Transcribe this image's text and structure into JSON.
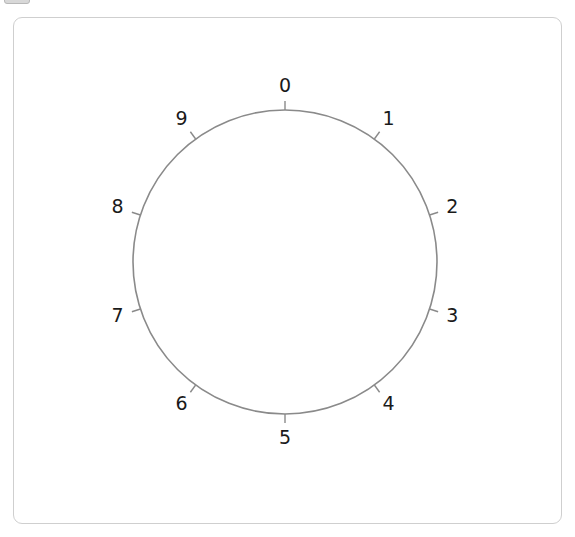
{
  "widget": {
    "title": "dial",
    "top_left_control_label": ""
  },
  "panel": {
    "background_color": "#ffffff",
    "border_color": "#cfcfcf",
    "corner_radius": 9
  },
  "chart_data": {
    "type": "scatter",
    "title": "",
    "subtitle": "",
    "xlabel": "",
    "ylabel": "",
    "grid": false,
    "legend": null,
    "circle": {
      "center_x": 285,
      "center_y": 262,
      "radius": 152,
      "stroke_color": "#8a8a8a",
      "stroke_width": 1.6
    },
    "tick_count": 10,
    "tick_length": 9,
    "tick_color": "#8a8a8a",
    "label_radius": 176,
    "start_angle_deg": -90,
    "direction": "clockwise",
    "categories": [
      "0",
      "1",
      "2",
      "3",
      "4",
      "5",
      "6",
      "7",
      "8",
      "9"
    ],
    "values": [
      0,
      1,
      2,
      3,
      4,
      5,
      6,
      7,
      8,
      9
    ],
    "points": [
      {
        "label": "0",
        "angle_deg": -90,
        "tick_x": 285.0,
        "tick_y": 110.0,
        "label_x": 285.0,
        "label_y": 86.0
      },
      {
        "label": "1",
        "angle_deg": -54,
        "tick_x": 374.3,
        "tick_y": 139.0,
        "label_x": 388.4,
        "label_y": 118.6
      },
      {
        "label": "2",
        "angle_deg": -18,
        "tick_x": 429.6,
        "tick_y": 215.0,
        "label_x": 452.4,
        "label_y": 207.6
      },
      {
        "label": "3",
        "angle_deg": 18,
        "tick_x": 429.6,
        "tick_y": 309.0,
        "label_x": 452.4,
        "label_y": 316.4
      },
      {
        "label": "4",
        "angle_deg": 54,
        "tick_x": 374.3,
        "tick_y": 385.0,
        "label_x": 388.4,
        "label_y": 405.4
      },
      {
        "label": "5",
        "angle_deg": 90,
        "tick_x": 285.0,
        "tick_y": 414.0,
        "label_x": 285.0,
        "label_y": 438.0
      },
      {
        "label": "6",
        "angle_deg": 126,
        "tick_x": 195.7,
        "tick_y": 385.0,
        "label_x": 181.6,
        "label_y": 405.4
      },
      {
        "label": "7",
        "angle_deg": 162,
        "tick_x": 140.4,
        "tick_y": 309.0,
        "label_x": 117.6,
        "label_y": 316.4
      },
      {
        "label": "8",
        "angle_deg": 198,
        "tick_x": 140.4,
        "tick_y": 215.0,
        "label_x": 117.6,
        "label_y": 207.6
      },
      {
        "label": "9",
        "angle_deg": 234,
        "tick_x": 195.7,
        "tick_y": 139.0,
        "label_x": 181.6,
        "label_y": 118.6
      }
    ]
  }
}
